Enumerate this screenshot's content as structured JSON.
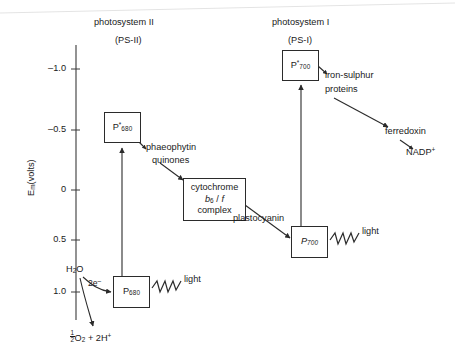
{
  "diagram": {
    "headers": {
      "ps2_name": "photosystem II",
      "ps2_abbrev": "(PS-II)",
      "ps1_name": "photosystem I",
      "ps1_abbrev": "(PS-I)"
    },
    "axis": {
      "label_main": "E",
      "label_sub": "m",
      "label_units": "(volts)",
      "ticks": [
        "–1.0",
        "–0.5",
        "0",
        "0.5",
        "1.0"
      ],
      "tick_values": [
        -1.0,
        -0.5,
        0,
        0.5,
        1.0
      ],
      "direction": "more negative upward"
    },
    "boxes": [
      {
        "id": "p680star",
        "main": "P",
        "star": "*",
        "sub": "680"
      },
      {
        "id": "cytochrome",
        "line1": "cytochrome",
        "line2_a": "b",
        "line2_sub": "6",
        "line2_b": " / ",
        "line2_c": "f",
        "line3": "complex"
      },
      {
        "id": "p700star",
        "main": "P",
        "star": "*",
        "sub": "700"
      },
      {
        "id": "p680",
        "main": "P",
        "sub": "680"
      },
      {
        "id": "p700",
        "main": "P",
        "sub": "700"
      }
    ],
    "labels": {
      "phaeophytin": "phaeophytin",
      "quinones": "quinones",
      "plastocyanin": "plastocyanin",
      "iron_sulphur_line1": "iron-sulphur",
      "iron_sulphur_line2": "proteins",
      "ferredoxin": "ferredoxin",
      "nadp": "NADP",
      "nadp_sup": "+",
      "water_main": "H",
      "water_sub": "2",
      "water_tail": "O",
      "two_electrons": "2e",
      "two_electrons_sup": "–",
      "oxygen_num": "1",
      "oxygen_den": "2",
      "oxygen_main": "O",
      "oxygen_sub": "2",
      "oxygen_plus": " + 2H",
      "oxygen_sup": "+",
      "light_ps2": "light",
      "light_ps1": "light"
    },
    "colors": {
      "background": "#ffffff",
      "ink": "#1a1a1a",
      "stroke": "#2b2b2b",
      "artifact": "#e2e2e2"
    }
  }
}
